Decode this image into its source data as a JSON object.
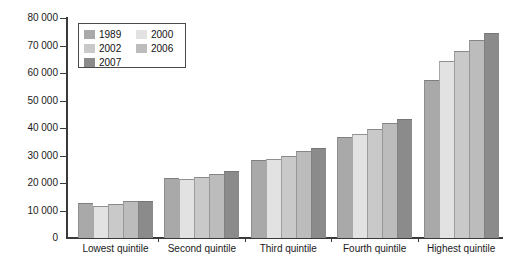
{
  "chart_data": {
    "type": "bar",
    "title": "",
    "subtitle": "",
    "xlabel": "",
    "ylabel": "",
    "ylim": [
      0,
      80000
    ],
    "ytick_step": 10000,
    "ytick_labels": [
      "80 000",
      "70 000",
      "60 000",
      "50 000",
      "40 000",
      "30 000",
      "20 000",
      "10 000",
      "0"
    ],
    "ytick_values": [
      80000,
      70000,
      60000,
      50000,
      40000,
      30000,
      20000,
      10000,
      0
    ],
    "grid": false,
    "legend_position": "top-left",
    "categories": [
      "Lowest quintile",
      "Second quintile",
      "Third quintile",
      "Fourth quintile",
      "Highest quintile"
    ],
    "series": [
      {
        "name": "1989",
        "color": "#a9a9a9",
        "values": [
          12800,
          21700,
          28200,
          36800,
          57500
        ]
      },
      {
        "name": "2000",
        "color": "#e2e2e2",
        "values": [
          11600,
          21500,
          28800,
          37900,
          64500
        ]
      },
      {
        "name": "2002",
        "color": "#c9c9c9",
        "values": [
          12300,
          22100,
          29900,
          39500,
          68000
        ]
      },
      {
        "name": "2006",
        "color": "#bcbcbc",
        "values": [
          13300,
          23200,
          31500,
          42000,
          72000
        ]
      },
      {
        "name": "2007",
        "color": "#8b8b8b",
        "values": [
          13600,
          24200,
          32600,
          43300,
          74500
        ]
      }
    ]
  },
  "legend": {
    "entries": [
      {
        "label": "1989",
        "color": "#a9a9a9"
      },
      {
        "label": "2000",
        "color": "#e2e2e2"
      },
      {
        "label": "2002",
        "color": "#c9c9c9"
      },
      {
        "label": "2006",
        "color": "#bcbcbc"
      },
      {
        "label": "2007",
        "color": "#8b8b8b"
      }
    ]
  },
  "axis": {
    "line_color": "#3a3a3a",
    "text_color": "#1a1a1a"
  }
}
